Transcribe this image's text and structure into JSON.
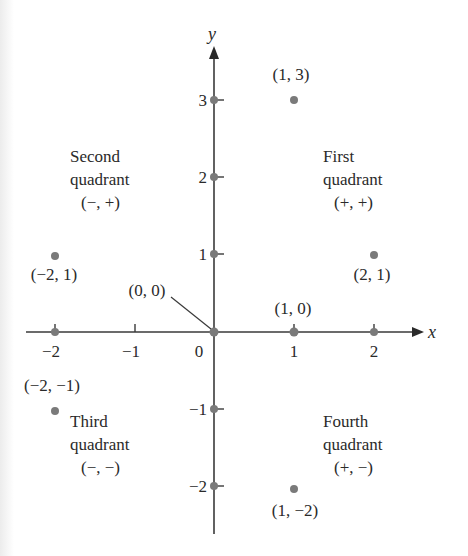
{
  "diagram": {
    "axes": {
      "x_label": "x",
      "y_label": "y",
      "x_ticks": [
        {
          "value": -2,
          "label": "−2"
        },
        {
          "value": -1,
          "label": "−1"
        },
        {
          "value": 0,
          "label": "0"
        },
        {
          "value": 1,
          "label": "1"
        },
        {
          "value": 2,
          "label": "2"
        }
      ],
      "y_ticks": [
        {
          "value": 3,
          "label": "3"
        },
        {
          "value": 2,
          "label": "2"
        },
        {
          "value": 1,
          "label": "1"
        },
        {
          "value": -1,
          "label": "−1"
        },
        {
          "value": -2,
          "label": "−2"
        }
      ]
    },
    "quadrants": [
      {
        "name": "First",
        "line1": "First",
        "line2": "quadrant",
        "signs": "(+, +)"
      },
      {
        "name": "Second",
        "line1": "Second",
        "line2": "quadrant",
        "signs": "(−, +)"
      },
      {
        "name": "Third",
        "line1": "Third",
        "line2": "quadrant",
        "signs": "(−, −)"
      },
      {
        "name": "Fourth",
        "line1": "Fourth",
        "line2": "quadrant",
        "signs": "(+, −)"
      }
    ],
    "points": [
      {
        "x": 1,
        "y": 3,
        "label": "(1, 3)"
      },
      {
        "x": -2,
        "y": 1,
        "label": "(−2, 1)"
      },
      {
        "x": 2,
        "y": 1,
        "label": "(2, 1)"
      },
      {
        "x": 0,
        "y": 0,
        "label": "(0, 0)"
      },
      {
        "x": 1,
        "y": 0,
        "label": "(1, 0)"
      },
      {
        "x": -2,
        "y": -1,
        "label": "(−2, −1)"
      },
      {
        "x": 1,
        "y": -2,
        "label": "(1, −2)"
      }
    ],
    "colors": {
      "axis": "#3a3a3a",
      "point": "#7a7a7a",
      "text": "#2a2a2a"
    }
  }
}
